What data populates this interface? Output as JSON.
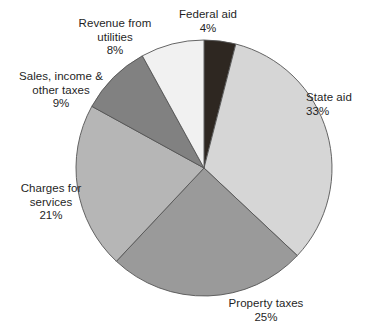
{
  "chart_data": {
    "type": "pie",
    "title": "",
    "subtitle": "",
    "xlabel": "",
    "ylabel": "",
    "legend_position": "none",
    "grid": false,
    "units": "percent",
    "total": 100,
    "start_angle_deg": 0,
    "direction": "clockwise",
    "categories": [
      "Federal aid",
      "State aid",
      "Property taxes",
      "Charges for services",
      "Sales, income & other taxes",
      "Revenue from utilities"
    ],
    "values": [
      4,
      33,
      25,
      21,
      9,
      8
    ],
    "slices": [
      {
        "id": "federal-aid",
        "label_line1": "Federal aid",
        "label_line2": "",
        "percent_text": "4%",
        "value": 4,
        "color": "#2e2721"
      },
      {
        "id": "state-aid",
        "label_line1": "State aid",
        "label_line2": "",
        "percent_text": "33%",
        "value": 33,
        "color": "#d6d6d6"
      },
      {
        "id": "property-taxes",
        "label_line1": "Property taxes",
        "label_line2": "",
        "percent_text": "25%",
        "value": 25,
        "color": "#9a9a9a"
      },
      {
        "id": "charges-for-services",
        "label_line1": "Charges for",
        "label_line2": "services",
        "percent_text": "21%",
        "value": 21,
        "color": "#b6b6b6"
      },
      {
        "id": "sales-income-other-taxes",
        "label_line1": "Sales, income &",
        "label_line2": "other taxes",
        "percent_text": "9%",
        "value": 9,
        "color": "#818181"
      },
      {
        "id": "revenue-from-utilities",
        "label_line1": "Revenue from",
        "label_line2": "utilities",
        "percent_text": "8%",
        "value": 8,
        "color": "#f1f1f1"
      }
    ],
    "geometry": {
      "center_x": 204,
      "center_y": 168,
      "radius": 128
    },
    "colors": {
      "background": "#ffffff",
      "outline": "#555555",
      "text": "#1f1f1f"
    }
  }
}
